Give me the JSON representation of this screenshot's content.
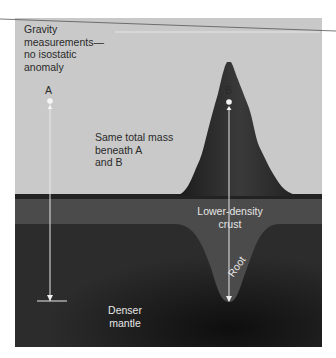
{
  "diagram": {
    "title_label": "Gravity\nmeasurements—\nno isostatic\nanomaly",
    "point_a": "A",
    "point_b": "B",
    "mass_label": "Same total mass\nbeneath A\nand B",
    "crust_label": "Lower-density\ncrust",
    "root_label": "Root",
    "mantle_label": "Denser\nmantle",
    "colors": {
      "air": "#c9c9c9",
      "crust": "#4a4a4a",
      "mountain": "#2b2b2b",
      "mantle": "#262626",
      "marker": "#f2f2f2"
    }
  }
}
